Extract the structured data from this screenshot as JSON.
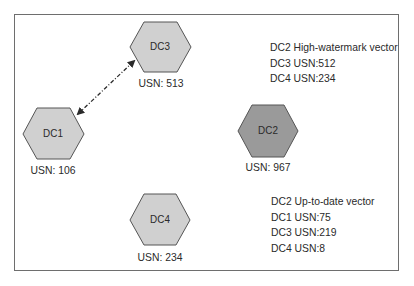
{
  "diagram": {
    "type": "replication-topology",
    "colors": {
      "hex_fill_light": "#d0d0d0",
      "hex_fill_dark": "#9a9a9a",
      "hex_stroke": "#555555",
      "frame_stroke": "#6e6e6e",
      "text": "#2a2a2a"
    },
    "nodes": [
      {
        "id": "DC1",
        "label": "DC1",
        "usn_label": "USN: 106",
        "usn": 106,
        "shade": "light"
      },
      {
        "id": "DC2",
        "label": "DC2",
        "usn_label": "USN: 967",
        "usn": 967,
        "shade": "dark"
      },
      {
        "id": "DC3",
        "label": "DC3",
        "usn_label": "USN: 513",
        "usn": 513,
        "shade": "light"
      },
      {
        "id": "DC4",
        "label": "DC4",
        "usn_label": "USN: 234",
        "usn": 234,
        "shade": "light"
      }
    ],
    "edges": [
      {
        "from": "DC1",
        "to": "DC3",
        "style": "dash-dot",
        "direction": "bidirectional"
      }
    ],
    "high_watermark": {
      "title": "DC2 High-watermark vector",
      "entries": [
        "DC3 USN:512",
        "DC4 USN:234"
      ]
    },
    "up_to_date": {
      "title": "DC2 Up-to-date vector",
      "entries": [
        "DC1 USN:75",
        "DC3 USN:219",
        "DC4 USN:8"
      ]
    }
  }
}
